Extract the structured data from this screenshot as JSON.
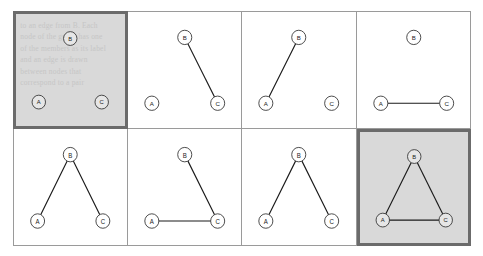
{
  "figure": {
    "title": "",
    "nodes": [
      {
        "id": "A",
        "label": "A",
        "x": 21,
        "y": 79
      },
      {
        "id": "B",
        "label": "B",
        "x": 50,
        "y": 22
      },
      {
        "id": "C",
        "label": "C",
        "x": 79,
        "y": 79
      }
    ],
    "grid": {
      "columns": 4,
      "rows": 2
    },
    "colors": {
      "page_background": "#ffffff",
      "cell_border": "#9a9a9a",
      "highlight_fill": "#d9d9d9",
      "highlight_border": "#6b6b6b",
      "edge": "#1b1b1b",
      "node_stroke": "#3a3a3a",
      "node_fill": "#ffffff",
      "label": "#1b1b1b",
      "ghost_text": "#c3c3c3"
    },
    "ghost_text_lines": [
      "to an edge from B. Each",
      "node of the graph has one",
      "of the members as its label",
      "and an edge is drawn",
      "between nodes that",
      "correspond to a pair"
    ],
    "panels": [
      {
        "index": 1,
        "highlighted": true,
        "edges": [],
        "edge_count": 0
      },
      {
        "index": 2,
        "highlighted": false,
        "edges": [
          "B-C"
        ],
        "edge_count": 1
      },
      {
        "index": 3,
        "highlighted": false,
        "edges": [
          "A-B"
        ],
        "edge_count": 1
      },
      {
        "index": 4,
        "highlighted": false,
        "edges": [
          "A-C"
        ],
        "edge_count": 1
      },
      {
        "index": 5,
        "highlighted": false,
        "edges": [
          "A-B",
          "B-C"
        ],
        "edge_count": 2
      },
      {
        "index": 6,
        "highlighted": false,
        "edges": [
          "A-C",
          "B-C"
        ],
        "edge_count": 2
      },
      {
        "index": 7,
        "highlighted": false,
        "edges": [
          "A-B",
          "B-C"
        ],
        "edge_count": 2
      },
      {
        "index": 8,
        "highlighted": true,
        "edges": [
          "A-B",
          "B-C",
          "A-C"
        ],
        "edge_count": 3
      }
    ]
  }
}
